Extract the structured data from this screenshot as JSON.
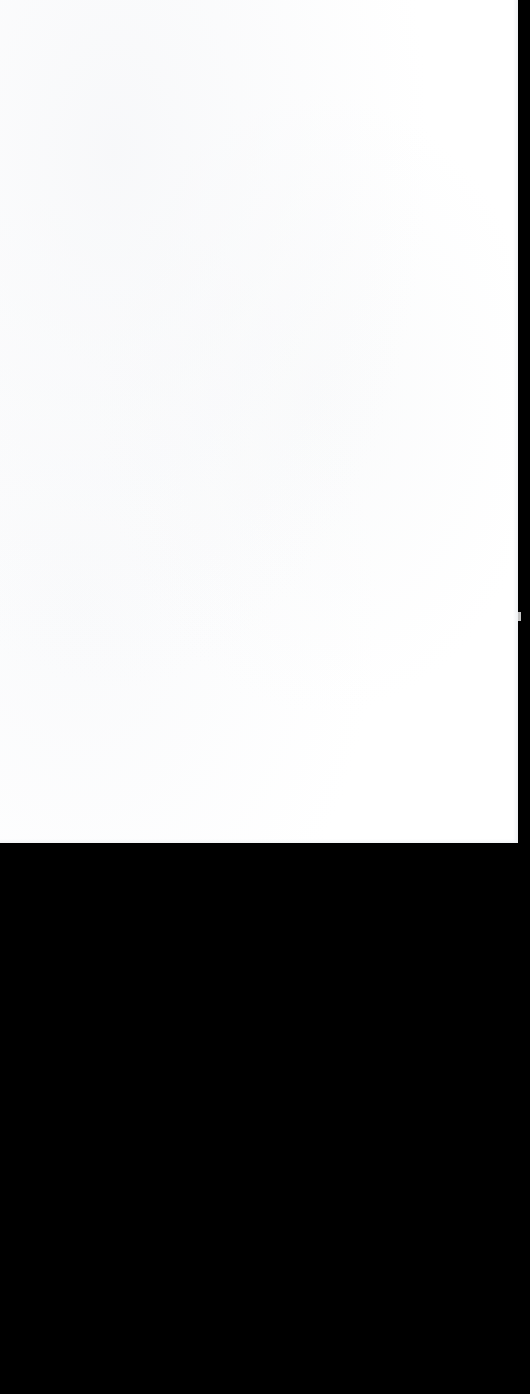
{
  "viewer": {
    "background_color": "#000000",
    "page_background_color": "#ffffff",
    "page_width_px": 518,
    "page_height_px": 843,
    "viewport_width_px": 530,
    "viewport_height_px": 1394
  },
  "page": {
    "content_text": "",
    "state_label": "",
    "is_blank": true
  },
  "markers": {
    "scroll_marker_color": "#d8d8d8",
    "scroll_marker_top_px": 612
  }
}
